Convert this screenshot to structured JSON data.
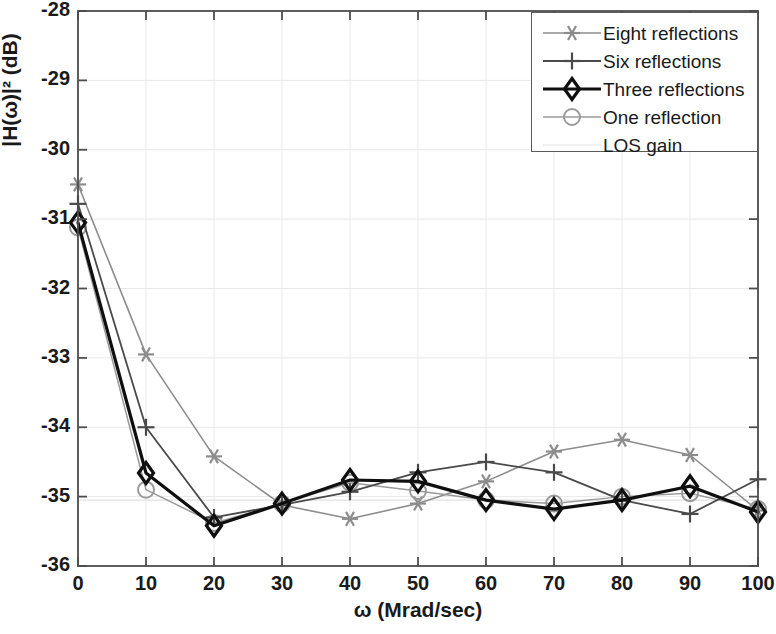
{
  "chart_data": {
    "type": "line",
    "title": "",
    "xlabel": "ω (Mrad/sec)",
    "ylabel": "|H(ω)|² (dB)",
    "x": [
      0,
      10,
      20,
      30,
      40,
      50,
      60,
      70,
      80,
      90,
      100
    ],
    "xlim": [
      0,
      100
    ],
    "ylim": [
      -36,
      -28
    ],
    "xticks": [
      "0",
      "10",
      "20",
      "30",
      "40",
      "50",
      "60",
      "70",
      "80",
      "90",
      "100"
    ],
    "yticks": [
      "-28",
      "-29",
      "-30",
      "-31",
      "-32",
      "-33",
      "-34",
      "-35",
      "-36"
    ],
    "grid": true,
    "legend_position": "top-right",
    "series": [
      {
        "name": "Eight reflections",
        "marker": "asterisk",
        "color": "#8c8c8c",
        "linewidth": 1.6,
        "values": [
          -30.5,
          -32.95,
          -34.42,
          -35.12,
          -35.32,
          -35.1,
          -34.78,
          -34.35,
          -34.18,
          -34.4,
          -35.2
        ]
      },
      {
        "name": "Six reflections",
        "marker": "plus",
        "color": "#4a4a4a",
        "linewidth": 1.8,
        "values": [
          -30.78,
          -34.0,
          -35.3,
          -35.12,
          -34.93,
          -34.65,
          -34.5,
          -34.65,
          -35.05,
          -35.25,
          -34.75
        ]
      },
      {
        "name": "Three reflections",
        "marker": "diamond",
        "color": "#0f0f0f",
        "linewidth": 3.2,
        "values": [
          -31.05,
          -34.66,
          -35.42,
          -35.1,
          -34.76,
          -34.78,
          -35.05,
          -35.18,
          -35.05,
          -34.85,
          -35.22
        ]
      },
      {
        "name": "One reflection",
        "marker": "circle",
        "color": "#9a9a9a",
        "linewidth": 1.5,
        "values": [
          -31.12,
          -34.9,
          -35.38,
          -35.1,
          -34.8,
          -34.92,
          -35.05,
          -35.1,
          -35.0,
          -34.95,
          -35.18
        ]
      },
      {
        "name": "LOS gain",
        "marker": "none",
        "color": "#e2e2e2",
        "linewidth": 1.2,
        "values": [
          -35.05,
          -35.05,
          -35.05,
          -35.05,
          -35.05,
          -35.05,
          -35.05,
          -35.05,
          -35.05,
          -35.05,
          -35.05
        ]
      }
    ]
  },
  "legend": {
    "items": [
      {
        "label": "Eight reflections"
      },
      {
        "label": "Six reflections"
      },
      {
        "label": "Three reflections"
      },
      {
        "label": "One reflection"
      },
      {
        "label": "LOS gain"
      }
    ]
  }
}
